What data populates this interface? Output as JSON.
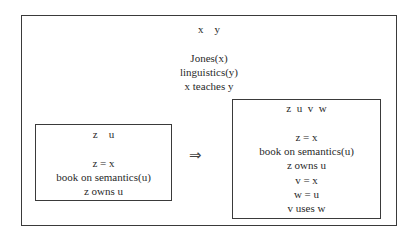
{
  "diagram": {
    "type": "DRS merging (Discourse Representation Structures)",
    "outer_drs": {
      "universe": "x    y",
      "conditions": [
        "Jones(x)",
        "linguistics(y)",
        "x teaches y"
      ]
    },
    "left_drs": {
      "universe": "z    u",
      "conditions": [
        "z = x",
        "book on semantics(u)",
        "z owns u"
      ]
    },
    "arrow": "⇒",
    "right_drs": {
      "universe": "z  u  v  w",
      "conditions": [
        "z = x",
        "book on semantics(u)",
        "z owns u",
        "v = x",
        "w = u",
        "v uses w"
      ]
    }
  }
}
